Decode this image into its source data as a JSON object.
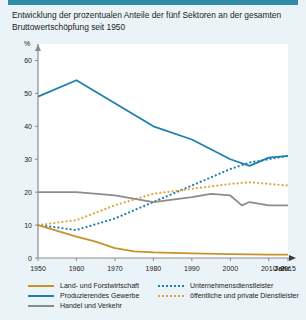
{
  "header": {
    "title": "Entwicklung der prozentualen Anteile der fünf Sektoren an der gesamten Bruttowertschöpfung seit 1950",
    "accent_color": "#2e8ca8"
  },
  "axis": {
    "y_unit": "%",
    "x_title": "Jahr",
    "y_ticks": [
      "0",
      "10",
      "20",
      "30",
      "40",
      "50",
      "60"
    ],
    "x_ticks": [
      "1950",
      "1960",
      "1970",
      "1980",
      "1990",
      "2000",
      "2010",
      "2015"
    ]
  },
  "legend": {
    "items": [
      {
        "label": "Land- und Forstwirtschaft",
        "color": "#c8922a",
        "style": "solid"
      },
      {
        "label": "Produzierendes Gewerbe",
        "color": "#1f7fad",
        "style": "solid"
      },
      {
        "label": "Handel und Verkehr",
        "color": "#8c8c8c",
        "style": "solid"
      },
      {
        "label": "Unternehmensdienstleister",
        "color": "#1f7fad",
        "style": "dotted"
      },
      {
        "label": "öffentliche und private Dienstleister",
        "color": "#e0a63c",
        "style": "dotted"
      }
    ]
  },
  "chart_data": {
    "type": "line",
    "title": "Entwicklung der prozentualen Anteile der fünf Sektoren an der gesamten Bruttowertschöpfung seit 1950",
    "xlabel": "Jahr",
    "ylabel": "%",
    "xlim": [
      1950,
      2015
    ],
    "ylim": [
      0,
      65
    ],
    "ytick_values": [
      0,
      10,
      20,
      30,
      40,
      50,
      60
    ],
    "xtick_values": [
      1950,
      1960,
      1970,
      1980,
      1990,
      2000,
      2010,
      2015
    ],
    "grid": false,
    "legend_position": "below",
    "series": [
      {
        "name": "Produzierendes Gewerbe",
        "color": "#1f7fad",
        "style": "solid",
        "x": [
          1950,
          1960,
          1970,
          1980,
          1990,
          2000,
          2005,
          2010,
          2015
        ],
        "values": [
          49,
          54,
          47,
          40,
          36,
          30,
          28,
          30.5,
          31
        ]
      },
      {
        "name": "Unternehmensdienstleister",
        "color": "#1f7fad",
        "style": "dotted",
        "x": [
          1950,
          1960,
          1970,
          1980,
          1990,
          2000,
          2005,
          2010,
          2015
        ],
        "values": [
          10,
          8.5,
          12,
          17,
          22,
          27,
          29,
          30,
          31
        ]
      },
      {
        "name": "öffentliche und private Dienstleister",
        "color": "#e0a63c",
        "style": "dotted",
        "x": [
          1950,
          1960,
          1970,
          1980,
          1990,
          2000,
          2005,
          2010,
          2015
        ],
        "values": [
          10,
          11.5,
          16,
          19.5,
          21,
          22.5,
          23,
          22.5,
          22
        ]
      },
      {
        "name": "Handel und Verkehr",
        "color": "#8c8c8c",
        "style": "solid",
        "x": [
          1950,
          1960,
          1970,
          1980,
          1990,
          1995,
          2000,
          2003,
          2005,
          2010,
          2015
        ],
        "values": [
          20,
          20,
          19,
          17,
          18.5,
          19.5,
          19,
          16,
          17,
          16,
          16
        ]
      },
      {
        "name": "Land- und Forstwirtschaft",
        "color": "#c8922a",
        "style": "solid",
        "x": [
          1950,
          1960,
          1965,
          1970,
          1975,
          1980,
          1990,
          2000,
          2010,
          2015
        ],
        "values": [
          10,
          6.5,
          5,
          3,
          2,
          1.7,
          1.4,
          1.2,
          1,
          1
        ]
      }
    ]
  }
}
